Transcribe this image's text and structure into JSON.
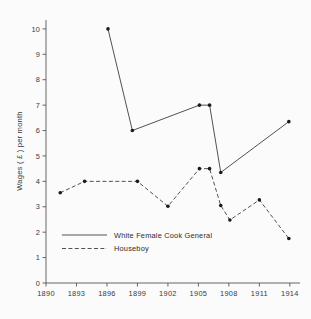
{
  "chart_data": {
    "type": "line",
    "title": "",
    "xlabel": "",
    "ylabel": "Wages ( £ ) per month",
    "xlim": [
      1890,
      1915
    ],
    "ylim": [
      0,
      10.35
    ],
    "grid": false,
    "legend_position": "inside-lower-left",
    "xticks": [
      1890,
      1893,
      1896,
      1899,
      1902,
      1905,
      1908,
      1911,
      1914
    ],
    "xtick_labels": [
      "1890",
      "1893",
      "1896",
      "1899",
      "1902",
      "1905",
      "1908",
      "1911",
      "1914"
    ],
    "yticks": [
      0,
      1,
      2,
      3,
      4,
      5,
      6,
      7,
      8,
      9,
      10
    ],
    "ytick_labels": [
      "0",
      "1",
      "2",
      "3",
      "4",
      "5",
      "6",
      "7",
      "8",
      "9",
      "10"
    ],
    "series": [
      {
        "name": "White Female Cook General",
        "style": "solid",
        "marker": "filled-circle",
        "x": [
          1896.1,
          1898.5,
          1905.1,
          1906.1,
          1907.2,
          1913.9
        ],
        "values": [
          10.0,
          6.0,
          7.0,
          7.0,
          4.35,
          6.35
        ]
      },
      {
        "name": "Houseboy",
        "style": "dashed",
        "marker": "filled-circle",
        "x": [
          1891.4,
          1893.8,
          1899.0,
          1902.0,
          1905.1,
          1906.1,
          1907.2,
          1908.1,
          1911.0,
          1913.9
        ],
        "values": [
          3.55,
          4.0,
          4.0,
          3.02,
          4.5,
          4.5,
          3.05,
          2.48,
          3.27,
          1.75
        ]
      }
    ]
  },
  "legend": {
    "entries": [
      {
        "label": "White Female Cook General",
        "style": "solid"
      },
      {
        "label": "Houseboy",
        "style": "dashed"
      }
    ]
  },
  "axes": {
    "y_axis_title": "Wages ( £ ) per month"
  }
}
